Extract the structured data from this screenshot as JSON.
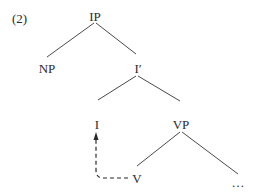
{
  "example_number": "(2)",
  "tree": {
    "nodes": [
      {
        "id": "IP",
        "label": "IP",
        "x": 95,
        "y": 16
      },
      {
        "id": "NP",
        "label": "NP",
        "x": 47,
        "y": 68
      },
      {
        "id": "Ibar",
        "label": "I′",
        "x": 138,
        "y": 68
      },
      {
        "id": "I",
        "label": "I",
        "x": 97,
        "y": 124
      },
      {
        "id": "VP",
        "label": "VP",
        "x": 181,
        "y": 124
      },
      {
        "id": "V",
        "label": "V",
        "x": 137,
        "y": 178
      },
      {
        "id": "ellipsis",
        "label": "…",
        "x": 238,
        "y": 183
      }
    ],
    "edges": [
      {
        "from": "IP",
        "to": "NP"
      },
      {
        "from": "IP",
        "to": "Ibar"
      },
      {
        "from": "Ibar",
        "to": "I"
      },
      {
        "from": "Ibar",
        "to": "VP"
      },
      {
        "from": "VP",
        "to": "V"
      },
      {
        "from": "VP",
        "to": "ellipsis"
      }
    ],
    "movement": {
      "from": "V",
      "to": "I",
      "style": "dashed-arrow"
    }
  },
  "colors": {
    "ink": "#2b2b2b",
    "background": "#ffffff"
  }
}
